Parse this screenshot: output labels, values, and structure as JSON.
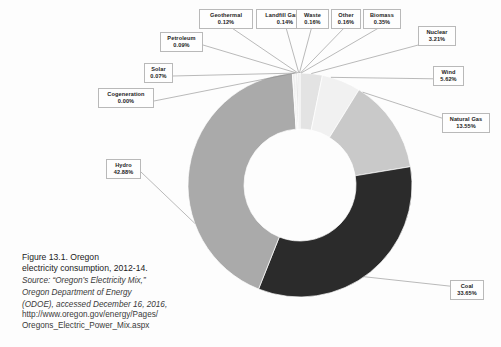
{
  "figure": {
    "caption_line1": "Figure 13.1. Oregon",
    "caption_line2": "electricity consumption, 2012-14.",
    "source_line1": "Source: “Oregon’s Electricity Mix,”",
    "source_line2": "Oregon Department of Energy",
    "source_line3": "(ODOE), accessed December 16, 2016,",
    "url_line1": "http://www.oregon.gov/energy/Pages/",
    "url_line2": "Oregons_Electric_Power_Mix.aspx"
  },
  "chart_data": {
    "type": "pie",
    "variant": "donut",
    "title": "Oregon electricity consumption, 2012-14",
    "units": "percent",
    "start_angle_deg": 0,
    "direction": "clockwise",
    "inner_radius_ratio": 0.5,
    "total": 100.0,
    "legend": "none",
    "labels_style": "callout-boxes-with-leader-lines",
    "categories": [
      "Nuclear",
      "Wind",
      "Natural Gas",
      "Coal",
      "Hydro",
      "Cogeneration",
      "Solar",
      "Petroleum",
      "Geothermal",
      "Landfill Gases",
      "Waste",
      "Other",
      "Biomass"
    ],
    "values": [
      3.21,
      5.62,
      13.55,
      33.65,
      42.88,
      0.0,
      0.07,
      0.09,
      0.12,
      0.14,
      0.16,
      0.16,
      0.35
    ],
    "value_labels": [
      "3.21%",
      "5.62%",
      "13.55%",
      "33.65%",
      "42.88%",
      "0.00%",
      "0.07%",
      "0.09%",
      "0.12%",
      "0.14%",
      "0.16%",
      "0.16%",
      "0.35%"
    ],
    "colors": [
      "#e3e3e3",
      "#f1f1f1",
      "#c9c9c9",
      "#2b2b2b",
      "#aaaaaa",
      "#9d9d9d",
      "#bdbdbd",
      "#d2d2d2",
      "#8f8f8f",
      "#c4c4c4",
      "#dcdcdc",
      "#9a9a9a",
      "#ededed"
    ],
    "slices": [
      {
        "name": "Nuclear",
        "value": 3.21,
        "label": "3.21%",
        "color": "#e3e3e3"
      },
      {
        "name": "Wind",
        "value": 5.62,
        "label": "5.62%",
        "color": "#f1f1f1"
      },
      {
        "name": "Natural Gas",
        "value": 13.55,
        "label": "13.55%",
        "color": "#c9c9c9"
      },
      {
        "name": "Coal",
        "value": 33.65,
        "label": "33.65%",
        "color": "#2b2b2b"
      },
      {
        "name": "Hydro",
        "value": 42.88,
        "label": "42.88%",
        "color": "#aaaaaa"
      },
      {
        "name": "Cogeneration",
        "value": 0.0,
        "label": "0.00%",
        "color": "#9d9d9d"
      },
      {
        "name": "Solar",
        "value": 0.07,
        "label": "0.07%",
        "color": "#bdbdbd"
      },
      {
        "name": "Petroleum",
        "value": 0.09,
        "label": "0.09%",
        "color": "#d2d2d2"
      },
      {
        "name": "Geothermal",
        "value": 0.12,
        "label": "0.12%",
        "color": "#8f8f8f"
      },
      {
        "name": "Landfill Gases",
        "value": 0.14,
        "label": "0.14%",
        "color": "#c4c4c4"
      },
      {
        "name": "Waste",
        "value": 0.16,
        "label": "0.16%",
        "color": "#dcdcdc"
      },
      {
        "name": "Other",
        "value": 0.16,
        "label": "0.16%",
        "color": "#9a9a9a"
      },
      {
        "name": "Biomass",
        "value": 0.35,
        "label": "0.35%",
        "color": "#ededed"
      }
    ]
  },
  "callouts": {
    "geothermal": {
      "name": "Geothermal",
      "value": "0.12%"
    },
    "landfill": {
      "name": "Landfill Gases",
      "value": "0.14%"
    },
    "waste": {
      "name": "Waste",
      "value": "0.16%"
    },
    "other": {
      "name": "Other",
      "value": "0.16%"
    },
    "biomass": {
      "name": "Biomass",
      "value": "0.35%"
    },
    "nuclear": {
      "name": "Nuclear",
      "value": "3.21%"
    },
    "wind": {
      "name": "Wind",
      "value": "5.62%"
    },
    "natural_gas": {
      "name": "Natural Gas",
      "value": "13.55%"
    },
    "coal": {
      "name": "Coal",
      "value": "33.65%"
    },
    "hydro": {
      "name": "Hydro",
      "value": "42.88%"
    },
    "petroleum": {
      "name": "Petroleum",
      "value": "0.09%"
    },
    "solar": {
      "name": "Solar",
      "value": "0.07%"
    },
    "cogeneration": {
      "name": "Cogeneration",
      "value": "0.00%"
    }
  }
}
